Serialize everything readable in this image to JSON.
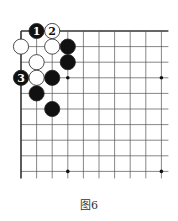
{
  "figure": {
    "caption": "图6"
  },
  "board": {
    "origin": [
      21,
      31
    ],
    "spacing": 15.6,
    "cols": 10,
    "rows": 10,
    "extend_right": 7,
    "extend_down": 7,
    "line_color": "#555555",
    "edge_color": "#333333",
    "star_points": [
      [
        3,
        3
      ],
      [
        9,
        3
      ],
      [
        3,
        9
      ],
      [
        9,
        9
      ]
    ],
    "stones": [
      {
        "color": "black",
        "col": 1,
        "row": 0,
        "label": "1"
      },
      {
        "color": "white",
        "col": 2,
        "row": 0,
        "label": "2"
      },
      {
        "color": "white",
        "col": 0,
        "row": 1,
        "label": ""
      },
      {
        "color": "white",
        "col": 2,
        "row": 1,
        "label": ""
      },
      {
        "color": "black",
        "col": 3,
        "row": 1,
        "label": ""
      },
      {
        "color": "white",
        "col": 1,
        "row": 2,
        "label": ""
      },
      {
        "color": "black",
        "col": 3,
        "row": 2,
        "label": ""
      },
      {
        "color": "black",
        "col": 0,
        "row": 3,
        "label": "3"
      },
      {
        "color": "white",
        "col": 1,
        "row": 3,
        "label": ""
      },
      {
        "color": "black",
        "col": 2,
        "row": 3,
        "label": ""
      },
      {
        "color": "black",
        "col": 1,
        "row": 4,
        "label": ""
      },
      {
        "color": "black",
        "col": 2,
        "row": 5,
        "label": ""
      }
    ]
  }
}
